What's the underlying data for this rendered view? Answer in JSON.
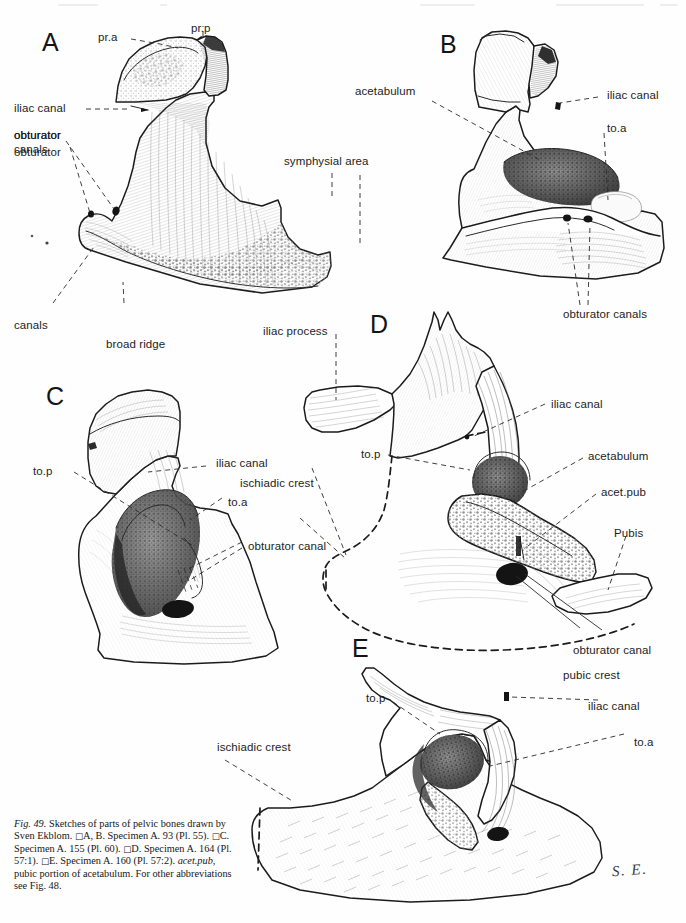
{
  "figure": {
    "id": "fig-49",
    "panels": [
      "A",
      "B",
      "C",
      "D",
      "E"
    ],
    "signature": "S. E."
  },
  "panel_letters": {
    "a": "A",
    "b": "B",
    "c": "C",
    "d": "D",
    "e": "E"
  },
  "labels": {
    "panel_a": [
      {
        "key": "pr_a",
        "text": "pr.a"
      },
      {
        "key": "pr_p",
        "text": "pr.p"
      },
      {
        "key": "iliac_canal",
        "text": "iliac canal"
      },
      {
        "key": "obturator_canals",
        "text": "obturator\ncanals"
      },
      {
        "key": "obturator_canals_l1",
        "text": "obturator"
      },
      {
        "key": "obturator_canals_l2",
        "text": "canals"
      },
      {
        "key": "broad_ridge",
        "text": "broad ridge"
      },
      {
        "key": "symphysial_area",
        "text": "symphysial area"
      },
      {
        "key": "ischiadic_crest",
        "text": "ischiadic crest"
      }
    ],
    "panel_b": [
      {
        "key": "acetabulum",
        "text": "acetabulum"
      },
      {
        "key": "iliac_canal",
        "text": "iliac canal"
      },
      {
        "key": "to_a",
        "text": "to.a"
      },
      {
        "key": "obturator_canals",
        "text": "obturator canals"
      }
    ],
    "panel_c": [
      {
        "key": "to_p",
        "text": "to.p"
      },
      {
        "key": "iliac_canal",
        "text": "iliac canal"
      },
      {
        "key": "ischiadic_crest",
        "text": "ischiadic crest"
      },
      {
        "key": "to_a",
        "text": "to.a"
      },
      {
        "key": "obturator_canal",
        "text": "obturator canal"
      }
    ],
    "panel_d": [
      {
        "key": "iliac_process",
        "text": "iliac process"
      },
      {
        "key": "iliac_canal",
        "text": "iliac canal"
      },
      {
        "key": "to_p",
        "text": "to.p"
      },
      {
        "key": "acetabulum",
        "text": "acetabulum"
      },
      {
        "key": "acet_pub",
        "text": "acet.pub"
      },
      {
        "key": "pubis",
        "text": "Pubis"
      },
      {
        "key": "obturator_canal",
        "text": "obturator canal"
      },
      {
        "key": "pubic_crest",
        "text": "pubic crest"
      }
    ],
    "panel_e": [
      {
        "key": "to_p",
        "text": "to.p"
      },
      {
        "key": "iliac_canal",
        "text": "iliac canal"
      },
      {
        "key": "to_a",
        "text": "to.a"
      },
      {
        "key": "ischiadic_crest",
        "text": "ischiadic crest"
      }
    ]
  },
  "caption": {
    "fig_number": "Fig. 49.",
    "line_1": "Sketches of parts of pelvic bones drawn",
    "line_2": "by Sven Ekblom.",
    "entry_ab": "A, B. Specimen A. 93 (Pl. 55).",
    "entry_c": "C. Specimen A. 155 (Pl. 60).",
    "entry_d": "D. Specimen A. 164 (Pl. 57:1).",
    "entry_e": "E. Specimen A. 160 (Pl. 57:2).",
    "abbrev_term": "acet.pub,",
    "abbrev_def": "pubic portion of acetabulum.",
    "cross_ref": "For other abbreviations see Fig. 48.",
    "full_text": "Fig. 49. Sketches of parts of pelvic bones drawn by Sven Ekblom. □A, B. Specimen A. 93 (Pl. 55). □C. Specimen A. 155 (Pl. 60). □D. Specimen A. 164 (Pl. 57:1). □E. Specimen A. 160 (Pl. 57:2). acet.pub, pubic portion of acetabulum. For other abbreviations see Fig. 48."
  },
  "colors": {
    "background": "#ffffff",
    "ink": "#1b1b1b",
    "hatch": "#5a5a5a",
    "dark_fill": "#2b2b2b",
    "foramen": "#141414"
  }
}
